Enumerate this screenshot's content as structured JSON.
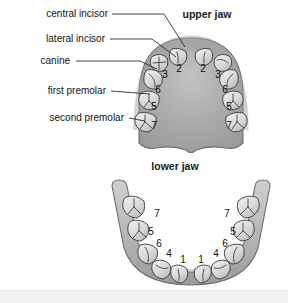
{
  "figure": {
    "title_upper": "upper jaw",
    "title_lower": "lower jaw",
    "background_color": "#ffffff",
    "gum_color": "#b8b8b8",
    "palate_color": "#ababab",
    "tooth_color": "#dcdcdc",
    "outline_color": "#3a3a3a",
    "leader_color": "#2b2b2b",
    "text_color": "#141414",
    "footer_band_color": "#f2f2f2"
  },
  "labels": [
    {
      "text": "central incisor",
      "x": 108,
      "y": 17
    },
    {
      "text": "lateral incisor",
      "x": 105,
      "y": 42
    },
    {
      "text": "canine",
      "x": 70,
      "y": 64
    },
    {
      "text": "first premolar",
      "x": 106,
      "y": 94
    },
    {
      "text": "second premolar",
      "x": 124,
      "y": 121
    }
  ],
  "leaders": [
    {
      "name": "leader-central-incisor",
      "x1": 112,
      "y1": 14,
      "x2": 165,
      "y2": 14,
      "x3": 200,
      "y3": 45
    },
    {
      "name": "leader-lateral-incisor",
      "x1": 110,
      "y1": 39,
      "x2": 150,
      "y2": 39,
      "x3": 176,
      "y3": 55
    },
    {
      "name": "leader-canine",
      "x1": 76,
      "y1": 61,
      "x2": 140,
      "y2": 61,
      "x3": 165,
      "y3": 68
    },
    {
      "name": "leader-first-premolar",
      "x1": 111,
      "y1": 91,
      "x2": 148,
      "y2": 91,
      "x3": 153,
      "y3": 91
    },
    {
      "name": "leader-second-premolar",
      "x1": 129,
      "y1": 118,
      "x2": 150,
      "y2": 118,
      "x3": 150,
      "y3": 118
    }
  ],
  "upper_jaw": {
    "numbers": [
      {
        "value": "2",
        "x": 179,
        "y": 68
      },
      {
        "value": "2",
        "x": 203,
        "y": 68
      },
      {
        "value": "3",
        "x": 164,
        "y": 74
      },
      {
        "value": "3",
        "x": 218,
        "y": 74
      },
      {
        "value": "6",
        "x": 157,
        "y": 88
      },
      {
        "value": "6",
        "x": 226,
        "y": 88
      },
      {
        "value": "5",
        "x": 154,
        "y": 104
      },
      {
        "value": "5",
        "x": 229,
        "y": 104
      },
      {
        "value": "7",
        "x": 154,
        "y": 122
      },
      {
        "value": "7",
        "x": 229,
        "y": 122
      }
    ]
  },
  "lower_jaw": {
    "numbers": [
      {
        "value": "7",
        "x": 157,
        "y": 213
      },
      {
        "value": "7",
        "x": 227,
        "y": 213
      },
      {
        "value": "5",
        "x": 151,
        "y": 231
      },
      {
        "value": "5",
        "x": 233,
        "y": 231
      },
      {
        "value": "6",
        "x": 158,
        "y": 243
      },
      {
        "value": "6",
        "x": 226,
        "y": 243
      },
      {
        "value": "4",
        "x": 168,
        "y": 253
      },
      {
        "value": "4",
        "x": 216,
        "y": 253
      },
      {
        "value": "1",
        "x": 182,
        "y": 259
      },
      {
        "value": "1",
        "x": 202,
        "y": 259
      }
    ]
  },
  "tooth_key": {
    "1": "central incisor",
    "2": "central incisor (upper)",
    "3": "lateral incisor",
    "4": "lateral incisor (lower)",
    "5": "first premolar",
    "6": "canine",
    "7": "second premolar"
  }
}
